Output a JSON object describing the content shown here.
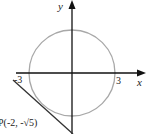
{
  "diagram": {
    "axes": {
      "x_label": "x",
      "y_label": "y"
    },
    "circle": {
      "center": [
        0,
        0
      ],
      "radius": 3,
      "color": "#a8a8a8"
    },
    "ticks": {
      "neg_x": "-3",
      "pos_x": "3"
    },
    "point": {
      "label": "P(-2, -√5)"
    },
    "tangent_line": {
      "color": "#333333",
      "through": [
        -2,
        -2.236
      ]
    },
    "axis_color": "#111111"
  }
}
